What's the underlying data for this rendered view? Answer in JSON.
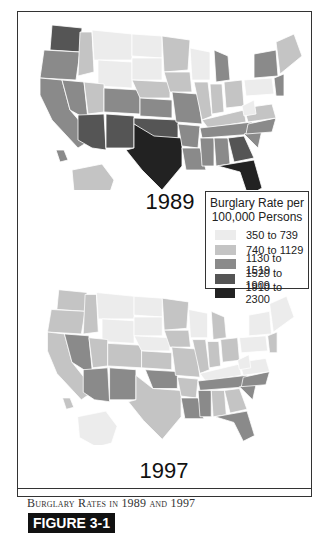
{
  "figure": {
    "label": "FIGURE 3-1",
    "caption": "Burglary Rates in 1989 and 1997"
  },
  "maps": [
    {
      "year": "1989",
      "title": "1989 burglary rate map of the United States"
    },
    {
      "year": "1997",
      "title": "1997 burglary rate map of the United States"
    }
  ],
  "legend": {
    "title_line1": "Burglary Rate per",
    "title_line2": "100,000 Persons",
    "items": [
      {
        "label": "350 to 739",
        "color": "#ececec"
      },
      {
        "label": "740 to 1129",
        "color": "#c4c4c4"
      },
      {
        "label": "1130 to 1519",
        "color": "#8a8a8a"
      },
      {
        "label": "1520 to 1909",
        "color": "#555555"
      },
      {
        "label": "1910 to 2300",
        "color": "#222222"
      }
    ]
  },
  "colors": {
    "c1": "#ececec",
    "c2": "#c4c4c4",
    "c3": "#8a8a8a",
    "c4": "#555555",
    "c5": "#222222",
    "border": "#333333"
  }
}
